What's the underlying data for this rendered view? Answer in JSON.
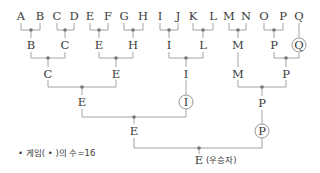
{
  "diagram": {
    "type": "tournament-bracket",
    "colors": {
      "line": "#9a9a9a",
      "dot": "#777777",
      "text": "#3a3a3a"
    },
    "players": [
      {
        "label": "A",
        "x": 21
      },
      {
        "label": "B",
        "x": 40
      },
      {
        "label": "C",
        "x": 57
      },
      {
        "label": "D",
        "x": 74
      },
      {
        "label": "E",
        "x": 90
      },
      {
        "label": "F",
        "x": 108
      },
      {
        "label": "G",
        "x": 124
      },
      {
        "label": "H",
        "x": 143
      },
      {
        "label": "I",
        "x": 160
      },
      {
        "label": "J",
        "x": 178
      },
      {
        "label": "K",
        "x": 193
      },
      {
        "label": "L",
        "x": 213
      },
      {
        "label": "M",
        "x": 229
      },
      {
        "label": "N",
        "x": 246
      },
      {
        "label": "O",
        "x": 264
      },
      {
        "label": "P",
        "x": 283
      },
      {
        "label": "Q",
        "x": 299
      }
    ],
    "rounds": [
      {
        "name": "round-1",
        "winners": [
          {
            "label": "B",
            "x": 31,
            "circled": false
          },
          {
            "label": "C",
            "x": 65,
            "circled": false
          },
          {
            "label": "E",
            "x": 99,
            "circled": false
          },
          {
            "label": "H",
            "x": 133,
            "circled": false
          },
          {
            "label": "I",
            "x": 169,
            "circled": false
          },
          {
            "label": "L",
            "x": 203,
            "circled": false
          },
          {
            "label": "M",
            "x": 238,
            "circled": false
          },
          {
            "label": "P",
            "x": 274,
            "circled": false
          },
          {
            "label": "Q",
            "x": 299,
            "circled": true
          }
        ]
      },
      {
        "name": "round-2",
        "winners": [
          {
            "label": "C",
            "x": 48,
            "circled": false
          },
          {
            "label": "E",
            "x": 116,
            "circled": false
          },
          {
            "label": "I",
            "x": 186,
            "circled": false
          },
          {
            "label": "M",
            "x": 238,
            "circled": false
          },
          {
            "label": "P",
            "x": 286,
            "circled": false
          }
        ]
      },
      {
        "name": "round-3",
        "winners": [
          {
            "label": "E",
            "x": 82,
            "circled": false
          },
          {
            "label": "I",
            "x": 186,
            "circled": true
          },
          {
            "label": "P",
            "x": 262,
            "circled": false
          }
        ]
      },
      {
        "name": "round-4",
        "winners": [
          {
            "label": "E",
            "x": 134,
            "circled": false
          },
          {
            "label": "P",
            "x": 262,
            "circled": true
          }
        ]
      }
    ],
    "champion": {
      "label": "E",
      "suffix": "(우승자)"
    },
    "note": "• 게임( • )의 수=16",
    "game_count": 16
  }
}
